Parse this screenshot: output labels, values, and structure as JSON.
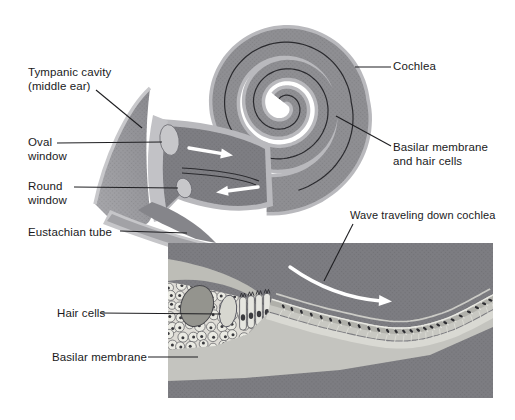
{
  "labels": {
    "tympanic_cavity": "Tympanic cavity\n(middle ear)",
    "oval_window": "Oval\nwindow",
    "round_window": "Round\nwindow",
    "eustachian_tube": "Eustachian tube",
    "cochlea": "Cochlea",
    "basilar_membrane_hair": "Basilar membrane\nand hair cells",
    "wave_traveling": "Wave traveling down cochlea",
    "hair_cells": "Hair cells",
    "basilar_membrane": "Basilar membrane"
  },
  "colors": {
    "background": "#ffffff",
    "cochlea_body": "#8f8f93",
    "cochlea_rim": "#b9b9bd",
    "duct_fill": "#7e7e83",
    "fan_light": "#a9a9ad",
    "fan_dark": "#8a8a8f",
    "window_fill": "#c7c7ca",
    "inset_background": "#7d7d82",
    "membrane_light": "#c8c8c2",
    "membrane_bright": "#e9e9e3",
    "cell_fill": "#eaeae3",
    "cell_outline": "#5a5a5f",
    "nucleus": "#3a3a3e",
    "ink": "#1f1f22",
    "arrow": "#ffffff"
  }
}
